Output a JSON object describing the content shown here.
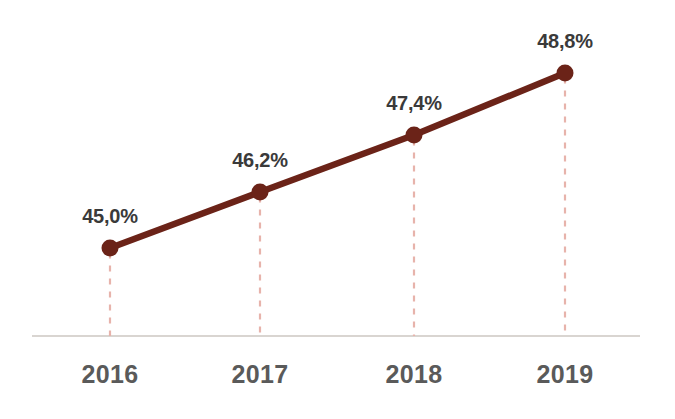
{
  "chart_data": {
    "type": "line",
    "title": "",
    "subtitle": "",
    "xlabel": "",
    "ylabel": "",
    "categories": [
      "2016",
      "2017",
      "2018",
      "2019"
    ],
    "values": [
      45.0,
      46.2,
      47.4,
      48.8
    ],
    "value_labels": [
      "45,0%",
      "46,2%",
      "47,4%",
      "48,8%"
    ],
    "series": [
      {
        "name": "",
        "values": [
          45.0,
          46.2,
          47.4,
          48.8
        ],
        "labels": [
          "45,0%",
          "46,2%",
          "47,4%",
          "48,8%"
        ]
      }
    ],
    "ylim": [
      44.0,
      49.6
    ],
    "grid": false,
    "legend": "none",
    "markers": "circle",
    "droplines": "dashed",
    "axis_line": "bottom-only",
    "colors": {
      "line": "#6b2318",
      "marker": "#6b2318",
      "dropline": "#e7b3ab",
      "axis": "#d9d5d1",
      "value_label_text": "#3a3a3a",
      "category_label_text": "#5a5a5a",
      "background": "#ffffff"
    },
    "points": [
      {
        "category": "2016",
        "label": "45,0%",
        "x": 110,
        "y": 248
      },
      {
        "category": "2017",
        "label": "46,2%",
        "x": 260,
        "y": 192
      },
      {
        "category": "2018",
        "label": "47,4%",
        "x": 414,
        "y": 135
      },
      {
        "category": "2019",
        "label": "48,8%",
        "x": 565,
        "y": 73
      }
    ],
    "axis": {
      "x_start": 32,
      "x_end": 640,
      "y": 336
    },
    "label_positions": [
      {
        "x": 110,
        "y": 226
      },
      {
        "x": 260,
        "y": 170
      },
      {
        "x": 414,
        "y": 113
      },
      {
        "x": 565,
        "y": 51
      }
    ],
    "category_label_y": 362
  }
}
